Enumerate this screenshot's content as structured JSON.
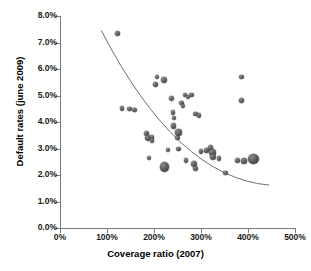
{
  "chart_data": {
    "type": "scatter",
    "title": "",
    "xlabel": "Coverage ratio (2007)",
    "ylabel": "Default rates (june 2009)",
    "xlim": [
      0,
      500
    ],
    "ylim": [
      0,
      8
    ],
    "grid": false,
    "legend": "none",
    "x_tick_labels": [
      "0%",
      "100%",
      "200%",
      "300%",
      "400%",
      "500%"
    ],
    "x_tick_values": [
      0,
      100,
      200,
      300,
      400,
      500
    ],
    "y_tick_labels": [
      "0.0%",
      "1.0%",
      "2.0%",
      "3.0%",
      "4.0%",
      "5.0%",
      "6.0%",
      "7.0%",
      "8.0%"
    ],
    "y_tick_values": [
      0,
      1,
      2,
      3,
      4,
      5,
      6,
      7,
      8
    ],
    "marker_color": "#5a5a5a",
    "trendline": {
      "present": true,
      "color": "#6f6f6f",
      "shape": "decreasing-curve",
      "start": {
        "x": 88,
        "y": 7.45
      },
      "end": {
        "x": 445,
        "y": 1.62
      }
    },
    "points": [
      {
        "x": 122,
        "y": 7.35,
        "size": 5.0
      },
      {
        "x": 132,
        "y": 4.5,
        "size": 4.6
      },
      {
        "x": 148,
        "y": 4.5,
        "size": 4.4
      },
      {
        "x": 158,
        "y": 4.45,
        "size": 4.6
      },
      {
        "x": 184,
        "y": 3.58,
        "size": 5.0
      },
      {
        "x": 188,
        "y": 3.4,
        "size": 5.8
      },
      {
        "x": 196,
        "y": 3.42,
        "size": 4.6
      },
      {
        "x": 196,
        "y": 3.3,
        "size": 4.4
      },
      {
        "x": 190,
        "y": 2.63,
        "size": 4.2
      },
      {
        "x": 204,
        "y": 5.4,
        "size": 5.2
      },
      {
        "x": 206,
        "y": 5.7,
        "size": 4.4
      },
      {
        "x": 222,
        "y": 5.6,
        "size": 6.0
      },
      {
        "x": 222,
        "y": 2.3,
        "size": 9.2
      },
      {
        "x": 230,
        "y": 2.95,
        "size": 4.6
      },
      {
        "x": 238,
        "y": 4.9,
        "size": 4.8
      },
      {
        "x": 240,
        "y": 4.35,
        "size": 4.6
      },
      {
        "x": 242,
        "y": 4.15,
        "size": 4.2
      },
      {
        "x": 242,
        "y": 3.85,
        "size": 5.4
      },
      {
        "x": 252,
        "y": 3.6,
        "size": 6.4
      },
      {
        "x": 250,
        "y": 3.4,
        "size": 4.4
      },
      {
        "x": 252,
        "y": 2.98,
        "size": 4.8
      },
      {
        "x": 258,
        "y": 4.72,
        "size": 4.8
      },
      {
        "x": 262,
        "y": 4.6,
        "size": 4.2
      },
      {
        "x": 266,
        "y": 5.02,
        "size": 4.2
      },
      {
        "x": 272,
        "y": 4.95,
        "size": 4.6
      },
      {
        "x": 280,
        "y": 5.02,
        "size": 4.4
      },
      {
        "x": 288,
        "y": 4.3,
        "size": 4.6
      },
      {
        "x": 296,
        "y": 4.25,
        "size": 4.6
      },
      {
        "x": 268,
        "y": 2.55,
        "size": 4.2
      },
      {
        "x": 285,
        "y": 2.42,
        "size": 6.2
      },
      {
        "x": 288,
        "y": 2.25,
        "size": 5.0
      },
      {
        "x": 300,
        "y": 2.9,
        "size": 4.8
      },
      {
        "x": 312,
        "y": 2.92,
        "size": 4.6
      },
      {
        "x": 320,
        "y": 3.02,
        "size": 5.6
      },
      {
        "x": 324,
        "y": 2.85,
        "size": 7.0
      },
      {
        "x": 326,
        "y": 2.68,
        "size": 5.8
      },
      {
        "x": 338,
        "y": 2.62,
        "size": 4.6
      },
      {
        "x": 352,
        "y": 2.08,
        "size": 4.2
      },
      {
        "x": 378,
        "y": 2.55,
        "size": 5.0
      },
      {
        "x": 386,
        "y": 5.7,
        "size": 4.6
      },
      {
        "x": 386,
        "y": 4.82,
        "size": 4.6
      },
      {
        "x": 392,
        "y": 2.52,
        "size": 5.6
      },
      {
        "x": 412,
        "y": 2.6,
        "size": 10.4
      }
    ]
  }
}
